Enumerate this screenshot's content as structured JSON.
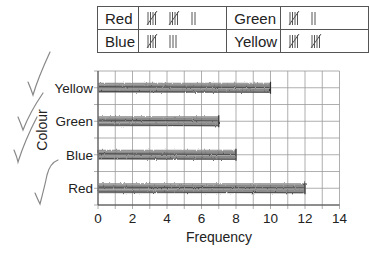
{
  "tally_table": {
    "rows": [
      [
        {
          "label": "Red",
          "count": 12
        },
        {
          "label": "Green",
          "count": 7
        }
      ],
      [
        {
          "label": "Blue",
          "count": 8
        },
        {
          "label": "Yellow",
          "count": 10
        }
      ]
    ]
  },
  "chart_data": {
    "type": "bar",
    "orientation": "horizontal",
    "title": "",
    "categories": [
      "Yellow",
      "Green",
      "Blue",
      "Red"
    ],
    "values": [
      10,
      7,
      8,
      12
    ],
    "xlabel": "Frequency",
    "ylabel": "Colour",
    "xlim": [
      0,
      14
    ],
    "xticks": [
      0,
      2,
      4,
      6,
      8,
      10,
      12,
      14
    ],
    "grid": true,
    "bar_style": "hand-drawn pencil shading",
    "annotations": [
      "handwritten tick marks beside each category label"
    ]
  },
  "labels": {
    "xlabel": "Frequency",
    "ylabel": "Colour",
    "cat0": "Yellow",
    "cat1": "Green",
    "cat2": "Blue",
    "cat3": "Red",
    "t0": "0",
    "t1": "2",
    "t2": "4",
    "t3": "6",
    "t4": "8",
    "t5": "10",
    "t6": "12",
    "t7": "14",
    "r0c0": "Red",
    "r0c1": "Green",
    "r1c0": "Blue",
    "r1c1": "Yellow"
  },
  "colors": {
    "bar": "#6e6e6e",
    "grid": "#9a9a9a",
    "tick_mark": "#777777"
  }
}
